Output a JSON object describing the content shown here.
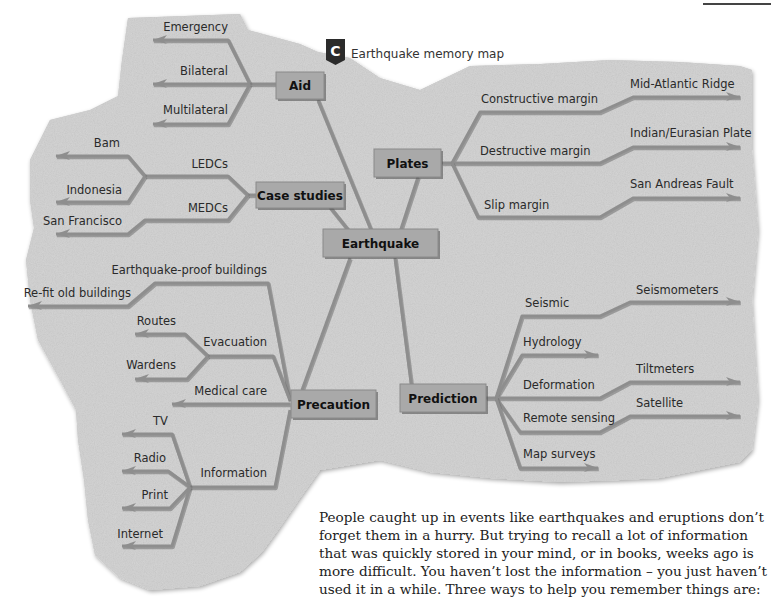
{
  "header": {
    "badge_letter": "C",
    "title": "Earthquake memory map"
  },
  "colors": {
    "stone": "#c9c9c9",
    "node_fill": "#a9a9a9",
    "branch": "#8e8e8e",
    "text": "#2a2a2a"
  },
  "mindmap": {
    "center": "Earthquake",
    "nodes": {
      "aid": {
        "label": "Aid",
        "branches": [
          "Emergency",
          "Bilateral",
          "Multilateral"
        ]
      },
      "case_studies": {
        "label": "Case studies",
        "branches": [
          {
            "label": "LEDCs",
            "children": [
              "Bam",
              "Indonesia"
            ]
          },
          {
            "label": "MEDCs",
            "children": [
              "San Francisco"
            ]
          }
        ]
      },
      "plates": {
        "label": "Plates",
        "branches": [
          {
            "label": "Constructive margin",
            "children": [
              "Mid-Atlantic Ridge"
            ]
          },
          {
            "label": "Destructive margin",
            "children": [
              "Indian/Eurasian Plate"
            ]
          },
          {
            "label": "Slip margin",
            "children": [
              "San Andreas Fault"
            ]
          }
        ]
      },
      "precaution": {
        "label": "Precaution",
        "branches": [
          {
            "label": "Earthquake-proof buildings",
            "children": [
              "Re-fit old buildings"
            ]
          },
          {
            "label": "Evacuation",
            "children": [
              "Routes",
              "Wardens"
            ]
          },
          {
            "label": "Medical care",
            "children": []
          },
          {
            "label": "Information",
            "children": [
              "TV",
              "Radio",
              "Print",
              "Internet"
            ]
          }
        ]
      },
      "prediction": {
        "label": "Prediction",
        "branches": [
          {
            "label": "Seismic",
            "children": [
              "Seismometers"
            ]
          },
          {
            "label": "Hydrology",
            "children": []
          },
          {
            "label": "Deformation",
            "children": [
              "Tiltmeters"
            ]
          },
          {
            "label": "Remote sensing",
            "children": [
              "Satellite"
            ]
          },
          {
            "label": "Map surveys",
            "children": []
          }
        ]
      }
    }
  },
  "body_text": {
    "lines": [
      "People caught up in events like earthquakes and eruptions don’t",
      "forget them in a hurry. But trying to recall a lot of information",
      "that was quickly stored in your mind, or in books, weeks ago is",
      "more difficult. You haven’t lost the information – you just haven’t",
      "used it in a while. Three ways to help you remember things are:"
    ]
  }
}
